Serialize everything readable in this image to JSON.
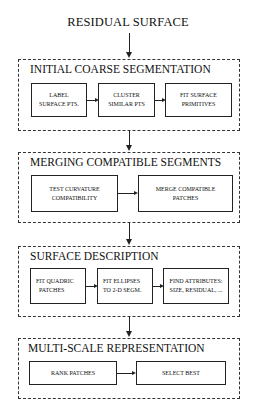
{
  "diagram": {
    "input_label": "RESIDUAL SURFACE",
    "stages": [
      {
        "title": "INITIAL COARSE SEGMENTATION",
        "steps": [
          {
            "line1": "LABEL",
            "line2": "SURFACE PTS."
          },
          {
            "line1": "CLUSTER",
            "line2": "SIMILAR PTS"
          },
          {
            "line1": "FIT SURFACE",
            "line2": "PRIMITIVES"
          }
        ]
      },
      {
        "title": "MERGING COMPATIBLE SEGMENTS",
        "steps": [
          {
            "line1": "TEST CURVATURE",
            "line2": "COMPATIBILITY"
          },
          {
            "line1": "MERGE COMPATIBLE",
            "line2": "PATCHES"
          }
        ]
      },
      {
        "title": "SURFACE DESCRIPTION",
        "steps": [
          {
            "line1": "FIT QUADRIC",
            "line2": "PATCHES"
          },
          {
            "line1": "FIT ELLIPSES",
            "line2": "TO 2-D SEGM."
          },
          {
            "line1": "FIND ATTRIBUTES:",
            "line2": "SIZE, RESIDUAL, ..."
          }
        ]
      },
      {
        "title": "MULTI-SCALE REPRESENTATION",
        "steps": [
          {
            "line1": "RANK PATCHES"
          },
          {
            "line1": "SELECT BEST"
          }
        ]
      }
    ]
  }
}
